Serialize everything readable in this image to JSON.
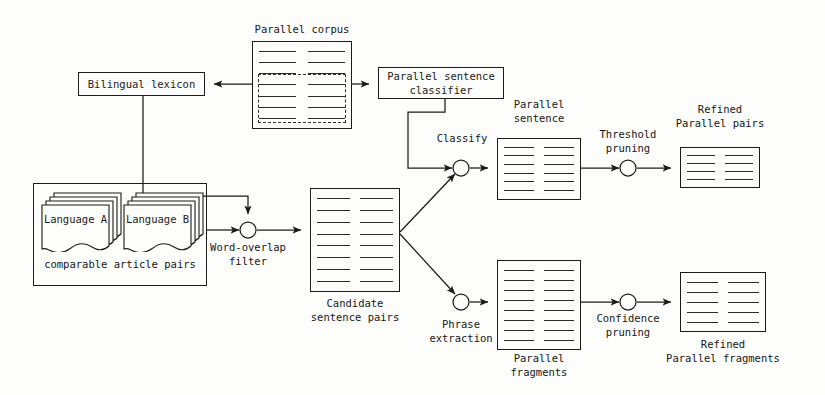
{
  "diagram": {
    "nodes": {
      "parallel_corpus": {
        "label": "Parallel corpus",
        "rows": 7,
        "columns": 2
      },
      "bilingual_lexicon": {
        "label": "Bilingual lexicon"
      },
      "parallel_sentence_classifier": {
        "label": "Parallel sentence\nclassifier"
      },
      "language_a": {
        "label": "Language A"
      },
      "language_b": {
        "label": "Language B"
      },
      "comparable_article_pairs": {
        "label": "comparable article pairs"
      },
      "word_overlap_filter": {
        "label": "Word-overlap\nfilter"
      },
      "candidate_sentence_pairs": {
        "label": "Candidate\nsentence pairs",
        "rows": 8,
        "columns": 2
      },
      "classify": {
        "label": "Classify"
      },
      "parallel_sentence": {
        "label": "Parallel\nsentence",
        "rows": 6,
        "columns": 2
      },
      "threshold_pruning": {
        "label": "Threshold\npruning"
      },
      "refined_parallel_pairs": {
        "label": "Refined\nParallel pairs",
        "rows": 4,
        "columns": 2
      },
      "phrase_extraction": {
        "label": "Phrase\nextraction"
      },
      "parallel_fragments": {
        "label": "Parallel\nfragments",
        "rows": 8,
        "columns": 2
      },
      "confidence_pruning": {
        "label": "Confidence\npruning"
      },
      "refined_parallel_fragments": {
        "label": "Refined\nParallel fragments",
        "rows": 5,
        "columns": 2
      }
    },
    "edges": [
      {
        "from": "parallel_corpus",
        "to": "bilingual_lexicon"
      },
      {
        "from": "parallel_corpus",
        "to": "parallel_sentence_classifier"
      },
      {
        "from": "bilingual_lexicon",
        "to": "word_overlap_filter"
      },
      {
        "from": "comparable_article_pairs",
        "to": "word_overlap_filter"
      },
      {
        "from": "word_overlap_filter",
        "to": "candidate_sentence_pairs"
      },
      {
        "from": "parallel_sentence_classifier",
        "to": "classify"
      },
      {
        "from": "candidate_sentence_pairs",
        "to": "classify"
      },
      {
        "from": "classify",
        "to": "parallel_sentence"
      },
      {
        "from": "parallel_sentence",
        "to": "threshold_pruning"
      },
      {
        "from": "threshold_pruning",
        "to": "refined_parallel_pairs"
      },
      {
        "from": "candidate_sentence_pairs",
        "to": "phrase_extraction"
      },
      {
        "from": "phrase_extraction",
        "to": "parallel_fragments"
      },
      {
        "from": "parallel_fragments",
        "to": "confidence_pruning"
      },
      {
        "from": "confidence_pruning",
        "to": "refined_parallel_fragments"
      }
    ],
    "colors": {
      "stroke": "#1b1b1b",
      "text": "#161616",
      "background": "#fdfdfb"
    }
  }
}
